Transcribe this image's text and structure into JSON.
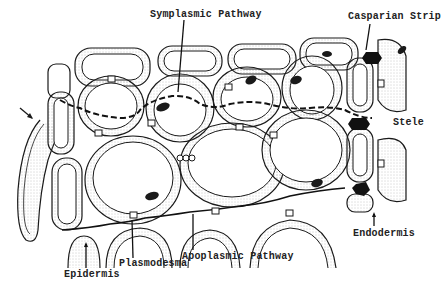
{
  "diagram": {
    "labels": {
      "symplasmic": "Symplasmic Pathway",
      "casparian": "Casparian Strip",
      "stele": "Stele",
      "endodermis": "Endodermis",
      "apoplasmic": "Apoplasmic Pathway",
      "plasmodesma": "Plasmodesma",
      "epidermis": "Epidermis"
    },
    "colors": {
      "line": "#1a1a1a",
      "stipple": "#bbbbbb",
      "background": "#ffffff"
    }
  }
}
